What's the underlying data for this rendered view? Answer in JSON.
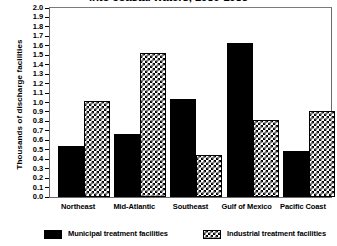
{
  "chart_data": {
    "type": "bar",
    "title": "into coastal waters, 1980-1985",
    "title_line1": "into coastal waters, 1980-1985",
    "xlabel": "",
    "ylabel": "Thousands of discharge facilities",
    "ylim": [
      0.0,
      2.0
    ],
    "grid": false,
    "legend_position": "bottom",
    "categories": [
      "Northeast",
      "Mid-Atlantic",
      "Southeast",
      "Gulf of Mexico",
      "Pacific Coast"
    ],
    "ytick_labels": [
      "2.0",
      "1.9",
      "1.8",
      "1.7",
      "1.6",
      "1.5",
      "1.4",
      "1.3",
      "1.2",
      "1.1",
      "1.0",
      "0.9",
      "0.8",
      "0.7",
      "0.6",
      "0.5",
      "0.4",
      "0.3",
      "0.2",
      "0.1",
      "0.0"
    ],
    "ytick_values": [
      2.0,
      1.9,
      1.8,
      1.7,
      1.6,
      1.5,
      1.4,
      1.3,
      1.2,
      1.1,
      1.0,
      0.9,
      0.8,
      0.7,
      0.6,
      0.5,
      0.4,
      0.3,
      0.2,
      0.1,
      0.0
    ],
    "series": [
      {
        "name": "Municipal treatment facilities",
        "fill": "solid-black",
        "values": [
          0.54,
          0.67,
          1.04,
          1.63,
          0.49
        ]
      },
      {
        "name": "Industrial treatment facilities",
        "fill": "black-white-checker",
        "values": [
          1.02,
          1.52,
          0.44,
          0.81,
          0.91
        ]
      }
    ]
  },
  "colors": {
    "municipal": "#000000",
    "industrial_pattern_fg": "#000000",
    "industrial_pattern_bg": "#ffffff",
    "frame": "#6a6a6a",
    "background": "#ffffff"
  }
}
